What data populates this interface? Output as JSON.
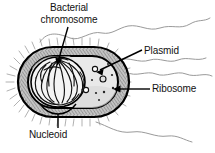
{
  "diagram": {
    "labels": {
      "chromosome_line1": "Bacterial",
      "chromosome_line2": "chromosome",
      "plasmid": "Plasmid",
      "ribosome": "Ribosome",
      "nucleoid": "Nucleoid"
    },
    "colors": {
      "outline": "#000000",
      "cell_wall_fill": "#b8b8b8",
      "cytoplasm_fill": "#e8e8e8",
      "nucleoid_fill": "#f2f2f2",
      "capsule_fringe": "#9a9a9a",
      "slime_line": "#8c8c8c",
      "text": "#111111",
      "background": "#ffffff"
    },
    "parts": [
      {
        "name": "capsule-slime-layer",
        "shape": "wavy-irregular-line"
      },
      {
        "name": "cell-wall",
        "shape": "rounded-rectangle-hatched"
      },
      {
        "name": "plasma-membrane",
        "shape": "inner-rounded-rectangle"
      },
      {
        "name": "cytoplasm",
        "shape": "inner-area"
      },
      {
        "name": "nucleoid",
        "shape": "oval-region-left"
      },
      {
        "name": "bacterial-chromosome",
        "shape": "tangled-looped-dna"
      },
      {
        "name": "plasmid",
        "shape": "small-ring",
        "count": 3
      },
      {
        "name": "ribosome",
        "shape": "small-dot",
        "count": 7
      }
    ]
  }
}
